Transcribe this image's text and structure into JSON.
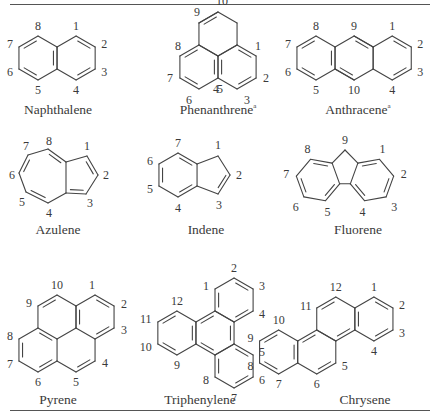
{
  "figure": {
    "structures": [
      {
        "id": "naphthalene",
        "name": "Naphthalene",
        "footnote": "",
        "labels": [
          "1",
          "2",
          "3",
          "4",
          "5",
          "6",
          "7",
          "8"
        ]
      },
      {
        "id": "phenanthrene",
        "name": "Phenanthrene",
        "footnote": "a",
        "labels": [
          "1",
          "2",
          "3",
          "4",
          "5",
          "6",
          "7",
          "8",
          "9",
          "10"
        ]
      },
      {
        "id": "anthracene",
        "name": "Anthracene",
        "footnote": "a",
        "labels": [
          "1",
          "2",
          "3",
          "4",
          "5",
          "6",
          "7",
          "8",
          "9",
          "10"
        ]
      },
      {
        "id": "azulene",
        "name": "Azulene",
        "footnote": "",
        "labels": [
          "1",
          "2",
          "3",
          "4",
          "5",
          "6",
          "7",
          "8"
        ]
      },
      {
        "id": "indene",
        "name": "Indene",
        "footnote": "",
        "labels": [
          "1",
          "2",
          "3",
          "4",
          "5",
          "6",
          "7"
        ]
      },
      {
        "id": "fluorene",
        "name": "Fluorene",
        "footnote": "",
        "labels": [
          "1",
          "2",
          "3",
          "4",
          "5",
          "6",
          "7",
          "8",
          "9"
        ]
      },
      {
        "id": "pyrene",
        "name": "Pyrene",
        "footnote": "",
        "labels": [
          "1",
          "2",
          "3",
          "4",
          "5",
          "6",
          "7",
          "8",
          "9",
          "10"
        ]
      },
      {
        "id": "triphenylene",
        "name": "Triphenylene",
        "footnote": "",
        "labels": [
          "1",
          "2",
          "3",
          "4",
          "5",
          "6",
          "7",
          "8",
          "9",
          "10",
          "11",
          "12"
        ]
      },
      {
        "id": "chrysene",
        "name": "Chrysene",
        "footnote": "",
        "labels": [
          "1",
          "2",
          "3",
          "4",
          "5",
          "6",
          "7",
          "8",
          "9",
          "10",
          "11",
          "12"
        ]
      }
    ]
  }
}
